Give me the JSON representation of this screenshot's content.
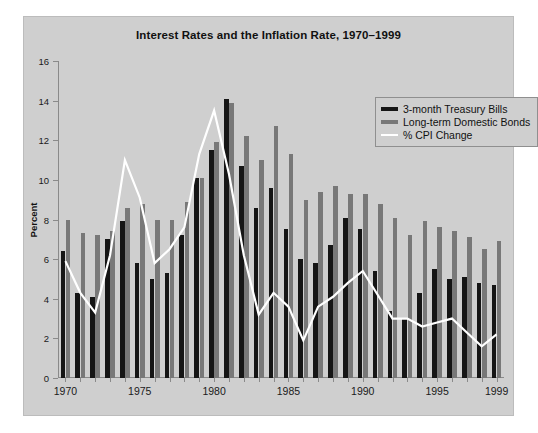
{
  "chart_data": {
    "type": "bar",
    "title": "Interest Rates and the Inflation Rate, 1970–1999",
    "xlabel": "",
    "ylabel": "Percent",
    "ylim": [
      0,
      16
    ],
    "ytick_step": 2,
    "yticks": [
      "16",
      "14",
      "12",
      "10",
      "8",
      "6",
      "4",
      "2",
      "0"
    ],
    "grid": false,
    "legend_position": "top-right",
    "categories": [
      "1970",
      "1971",
      "1972",
      "1973",
      "1974",
      "1975",
      "1976",
      "1977",
      "1978",
      "1979",
      "1980",
      "1981",
      "1982",
      "1983",
      "1984",
      "1985",
      "1986",
      "1987",
      "1988",
      "1989",
      "1990",
      "1991",
      "1992",
      "1993",
      "1994",
      "1995",
      "1996",
      "1997",
      "1998",
      "1999"
    ],
    "xtick_labels": [
      "1970",
      "1975",
      "1980",
      "1985",
      "1990",
      "1995",
      "1999"
    ],
    "series": [
      {
        "name": "3-month Treasury Bills",
        "type": "bar",
        "color": "#151515",
        "values": [
          6.4,
          4.3,
          4.1,
          7.0,
          7.9,
          5.8,
          5.0,
          5.3,
          7.2,
          10.1,
          11.5,
          14.1,
          10.7,
          8.6,
          9.6,
          7.5,
          6.0,
          5.8,
          6.7,
          8.1,
          7.5,
          5.4,
          3.4,
          3.0,
          4.3,
          5.5,
          5.0,
          5.1,
          4.8,
          4.7
        ]
      },
      {
        "name": "Long-term Domestic Bonds",
        "type": "bar",
        "color": "#787878",
        "values": [
          8.0,
          7.3,
          7.2,
          7.4,
          8.6,
          8.8,
          8.0,
          8.0,
          8.9,
          10.1,
          11.9,
          13.9,
          12.2,
          11.0,
          12.7,
          11.3,
          9.0,
          9.4,
          9.7,
          9.3,
          9.3,
          8.8,
          8.1,
          7.2,
          7.9,
          7.6,
          7.4,
          7.1,
          6.5,
          6.9
        ]
      },
      {
        "name": "% CPI Change",
        "type": "line",
        "color": "#ffffff",
        "values": [
          5.9,
          4.3,
          3.3,
          6.2,
          11.0,
          9.1,
          5.8,
          6.5,
          7.6,
          11.3,
          13.5,
          10.3,
          6.2,
          3.2,
          4.3,
          3.6,
          1.9,
          3.6,
          4.1,
          4.8,
          5.4,
          4.2,
          3.0,
          3.0,
          2.6,
          2.8,
          3.0,
          2.3,
          1.6,
          2.2
        ]
      }
    ]
  },
  "legend": {
    "items": [
      {
        "label": "3-month Treasury Bills",
        "color": "#151515",
        "style": "bar"
      },
      {
        "label": "Long-term Domestic Bonds",
        "color": "#787878",
        "style": "bar"
      },
      {
        "label": "% CPI Change",
        "color": "#ffffff",
        "style": "line"
      }
    ]
  }
}
